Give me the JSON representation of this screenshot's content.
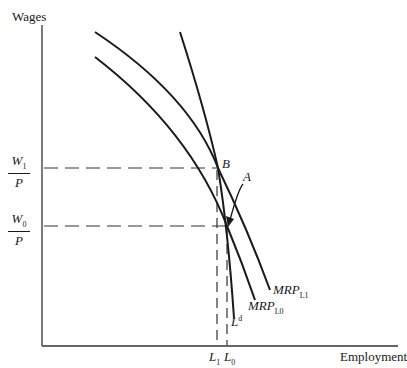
{
  "diagram": {
    "y_axis_label": "Wages",
    "x_axis_label": "Employment",
    "wage_levels": [
      {
        "num": "W",
        "num_sub": "1",
        "den": "P"
      },
      {
        "num": "W",
        "num_sub": "0",
        "den": "P"
      }
    ],
    "points": [
      {
        "label": "B",
        "x": 218,
        "y": 168
      },
      {
        "label": "A",
        "x": 227,
        "y": 226
      }
    ],
    "curves": [
      {
        "name": "MRP",
        "sub": "L1"
      },
      {
        "name": "MRP",
        "sub": "L0"
      },
      {
        "name": "L",
        "sup": "d"
      }
    ],
    "employment_levels": [
      {
        "name": "L",
        "sub": "1"
      },
      {
        "name": "L",
        "sub": "0"
      }
    ],
    "colors": {
      "line": "#1a1a1a",
      "background": "#ffffff"
    }
  }
}
